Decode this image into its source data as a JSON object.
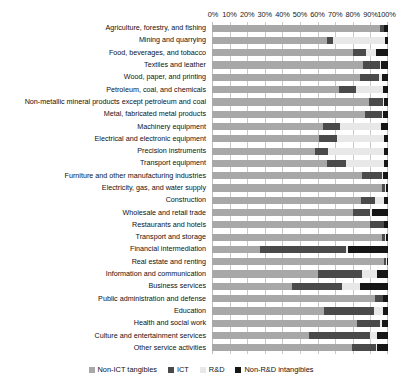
{
  "chart_data": {
    "type": "bar",
    "orientation": "horizontal",
    "stacked": true,
    "normalized": true,
    "title": "",
    "xlabel": "",
    "ylabel": "",
    "xlim": [
      0,
      100
    ],
    "grid": true,
    "legend_position": "bottom",
    "x_tick_labels": [
      "0%",
      "10%",
      "20%",
      "30%",
      "40%",
      "50%",
      "60%",
      "70%",
      "80%",
      "90%",
      "100%"
    ],
    "x_tick_values": [
      0,
      10,
      20,
      30,
      40,
      50,
      60,
      70,
      80,
      90,
      100
    ],
    "categories": [
      "Agriculture, forestry, and fishing",
      "Mining and quarrying",
      "Food, beverages, and tobacco",
      "Textiles and leather",
      "Wood, paper, and printing",
      "Petroleum, coal, and chemicals",
      "Non-metallic mineral products except petroleum and coal",
      "Metal, fabricated metal products",
      "Machinery equipment",
      "Electrical and electronic equipment",
      "Precision instruments",
      "Transport equipment",
      "Furniture and other manufacturing industries",
      "Electricity, gas, and water supply",
      "Construction",
      "Wholesale and retail trade",
      "Restaurants and hotels",
      "Transport and storage",
      "Financial intermediation",
      "Real estate and renting",
      "Information and communication",
      "Business services",
      "Public administration and defense",
      "Education",
      "Health and social work",
      "Culture and entertainment services",
      "Other service activities"
    ],
    "series": [
      {
        "name": "Non-ICT tangibles",
        "color": "#a8a8a8",
        "values": [
          95.5,
          65.5,
          80.0,
          86.0,
          84.0,
          72.0,
          89.0,
          87.0,
          63.0,
          61.0,
          58.5,
          65.5,
          85.0,
          96.5,
          84.5,
          80.0,
          89.5,
          96.5,
          27.0,
          97.5,
          60.5,
          45.5,
          92.5,
          63.5,
          82.5,
          55.0,
          79.5
        ]
      },
      {
        "name": "ICT",
        "color": "#4a4a4a",
        "values": [
          2.0,
          3.0,
          7.5,
          9.5,
          11.0,
          10.0,
          8.0,
          9.5,
          10.0,
          10.0,
          7.5,
          10.5,
          11.5,
          2.0,
          8.0,
          10.0,
          8.0,
          2.0,
          49.0,
          1.5,
          25.0,
          28.5,
          4.5,
          28.5,
          13.0,
          35.0,
          13.5
        ]
      },
      {
        "name": "R&D",
        "color": "#e8e8e8",
        "values": [
          0.5,
          30.0,
          5.5,
          0.5,
          1.5,
          15.0,
          0.5,
          0.5,
          23.0,
          26.5,
          31.5,
          21.5,
          0.5,
          0.5,
          5.5,
          1.0,
          0.5,
          0.5,
          1.0,
          0.5,
          8.5,
          10.0,
          0.0,
          5.0,
          1.0,
          3.5,
          1.0
        ]
      },
      {
        "name": "Non-R&D intangibles",
        "color": "#161616",
        "values": [
          2.0,
          1.5,
          7.0,
          4.0,
          3.5,
          3.0,
          2.5,
          3.0,
          4.0,
          2.5,
          2.5,
          2.5,
          3.0,
          1.0,
          2.0,
          9.0,
          2.0,
          1.0,
          23.0,
          0.5,
          6.0,
          16.0,
          3.0,
          3.0,
          3.5,
          6.5,
          6.0
        ]
      }
    ]
  },
  "legend": {
    "items": [
      {
        "label": "Non-ICT tangibles",
        "color": "#a8a8a8"
      },
      {
        "label": "ICT",
        "color": "#4a4a4a"
      },
      {
        "label": "R&D",
        "color": "#e8e8e8"
      },
      {
        "label": "Non-R&D intangibles",
        "color": "#161616"
      }
    ]
  }
}
